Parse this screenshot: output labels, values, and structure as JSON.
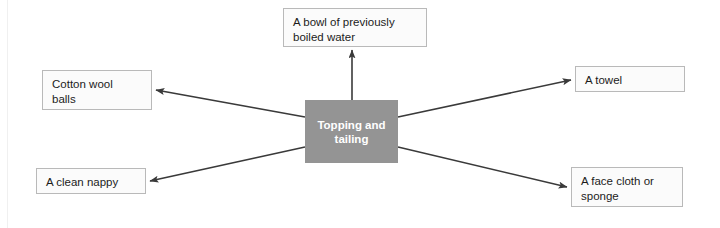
{
  "diagram": {
    "title": "Topping and tailing",
    "center": {
      "id": "center",
      "label": "Topping and\ntailing",
      "fill": "#949494",
      "text_color": "#ffffff",
      "x": 305,
      "y": 100,
      "width": 93,
      "height": 63
    },
    "node_fill": "#fbfbfb",
    "node_border": "#b9b9b9",
    "node_text_color": "#1b1b1b",
    "arrow_color": "#3a3a3a",
    "nodes": [
      {
        "id": "bowl-of-boiled-water",
        "label": "A bowl of previously\nboiled water",
        "x": 283,
        "y": 8,
        "width": 144,
        "height": 39
      },
      {
        "id": "cotton-wool-balls",
        "label": "Cotton wool\nballs",
        "x": 42,
        "y": 70,
        "width": 110,
        "height": 40
      },
      {
        "id": "a-towel",
        "label": "A towel",
        "x": 575,
        "y": 66,
        "width": 110,
        "height": 26
      },
      {
        "id": "a-clean-nappy",
        "label": "A clean nappy",
        "x": 36,
        "y": 168,
        "width": 110,
        "height": 26
      },
      {
        "id": "face-cloth-or-sponge",
        "label": "A face cloth or\nsponge",
        "x": 571,
        "y": 167,
        "width": 112,
        "height": 40
      }
    ],
    "edges": [
      {
        "id": "center-to-bowl-of-boiled-water",
        "from": "center",
        "to": "bowl-of-boiled-water",
        "x1": 352,
        "y1": 100,
        "x2": 352,
        "y2": 50
      },
      {
        "id": "center-to-cotton-wool-balls",
        "from": "center",
        "to": "cotton-wool-balls",
        "x1": 305,
        "y1": 117,
        "x2": 156,
        "y2": 90
      },
      {
        "id": "center-to-a-clean-nappy",
        "from": "center",
        "to": "a-clean-nappy",
        "x1": 305,
        "y1": 147,
        "x2": 150,
        "y2": 181
      },
      {
        "id": "center-to-a-towel",
        "from": "center",
        "to": "a-towel",
        "x1": 398,
        "y1": 117,
        "x2": 571,
        "y2": 80
      },
      {
        "id": "center-to-face-cloth-or-sponge",
        "from": "center",
        "to": "face-cloth-or-sponge",
        "x1": 398,
        "y1": 147,
        "x2": 567,
        "y2": 187
      }
    ]
  }
}
